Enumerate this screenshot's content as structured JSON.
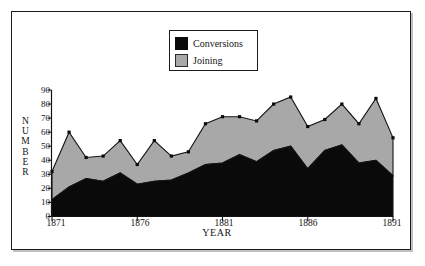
{
  "figure": {
    "yaxis_title": "NUMBER",
    "yaxis_letters": [
      "N",
      "U",
      "M",
      "B",
      "E",
      "R"
    ],
    "xaxis_title": "YEAR"
  },
  "legend": {
    "items": [
      {
        "label": "Conversions",
        "color": "#0a0a0a",
        "swatch": "conversions-swatch"
      },
      {
        "label": "Joining",
        "color": "#a8a8a8",
        "swatch": "joining-swatch"
      }
    ]
  },
  "axes": {
    "y_ticks": [
      "90",
      "80",
      "70",
      "60",
      "50",
      "40",
      "30",
      "20",
      "10",
      "0"
    ],
    "x_ticks": [
      "1871",
      "1876",
      "1881",
      "1886",
      "1891"
    ]
  },
  "chart_data": {
    "type": "area",
    "stacked": true,
    "title": "",
    "xlabel": "YEAR",
    "ylabel": "NUMBER",
    "xlim": [
      1871,
      1891
    ],
    "ylim": [
      0,
      90
    ],
    "grid": false,
    "legend_position": "top-center",
    "markers": true,
    "x": [
      1871,
      1872,
      1873,
      1874,
      1875,
      1876,
      1877,
      1878,
      1879,
      1880,
      1881,
      1882,
      1883,
      1884,
      1885,
      1886,
      1887,
      1888,
      1889,
      1890,
      1891
    ],
    "series": [
      {
        "name": "Conversions",
        "color": "#0a0a0a",
        "values": [
          12,
          21,
          27,
          25,
          31,
          23,
          25,
          26,
          31,
          37,
          38,
          44,
          39,
          47,
          50,
          34,
          47,
          51,
          38,
          40,
          29
        ]
      },
      {
        "name": "Joining",
        "color": "#a8a8a8",
        "values": [
          20,
          39,
          15,
          18,
          23,
          14,
          29,
          17,
          15,
          29,
          33,
          27,
          29,
          33,
          35,
          30,
          22,
          29,
          28,
          44,
          27
        ]
      }
    ],
    "totals": [
      32,
      60,
      42,
      43,
      54,
      37,
      54,
      43,
      46,
      66,
      71,
      71,
      68,
      80,
      85,
      64,
      69,
      80,
      66,
      84,
      56
    ]
  }
}
